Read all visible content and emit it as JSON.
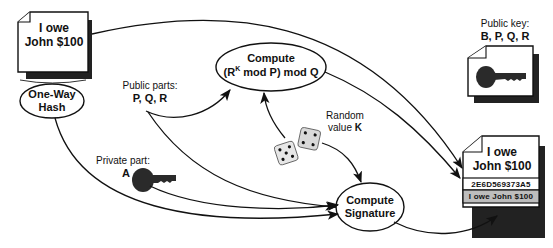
{
  "diagram": {
    "source_document": {
      "line1": "I owe",
      "line2": "John $100"
    },
    "hash_node": {
      "line1": "One-Way",
      "line2": "Hash"
    },
    "compute_r_node": {
      "line1": "Compute",
      "line2_prefix": "(R",
      "line2_sup": "K",
      "line2_suffix": " mod P) mod Q"
    },
    "compute_signature_node": {
      "line1": "Compute",
      "line2": "Signature"
    },
    "public_parts": {
      "label": "Public parts:",
      "value": "P, Q, R"
    },
    "private_part": {
      "label": "Private part:",
      "value": "A"
    },
    "random_value": {
      "label": "Random",
      "label2_prefix": "value ",
      "label2_value": "K"
    },
    "public_key": {
      "label": "Public key:",
      "value": "B, P, Q, R"
    },
    "signed_document": {
      "line1": "I owe",
      "line2": "John $100",
      "signature": "2E6D569373A5",
      "footer": "I owe John $100"
    },
    "icons": [
      "document-icon",
      "key-icon",
      "dice-icon",
      "arrow-icon"
    ],
    "colors": {
      "line": "#111111",
      "shadow": "#222222",
      "key": "#2a2a2a",
      "footer_band": "#bdbdbd",
      "background": "#ffffff"
    }
  }
}
